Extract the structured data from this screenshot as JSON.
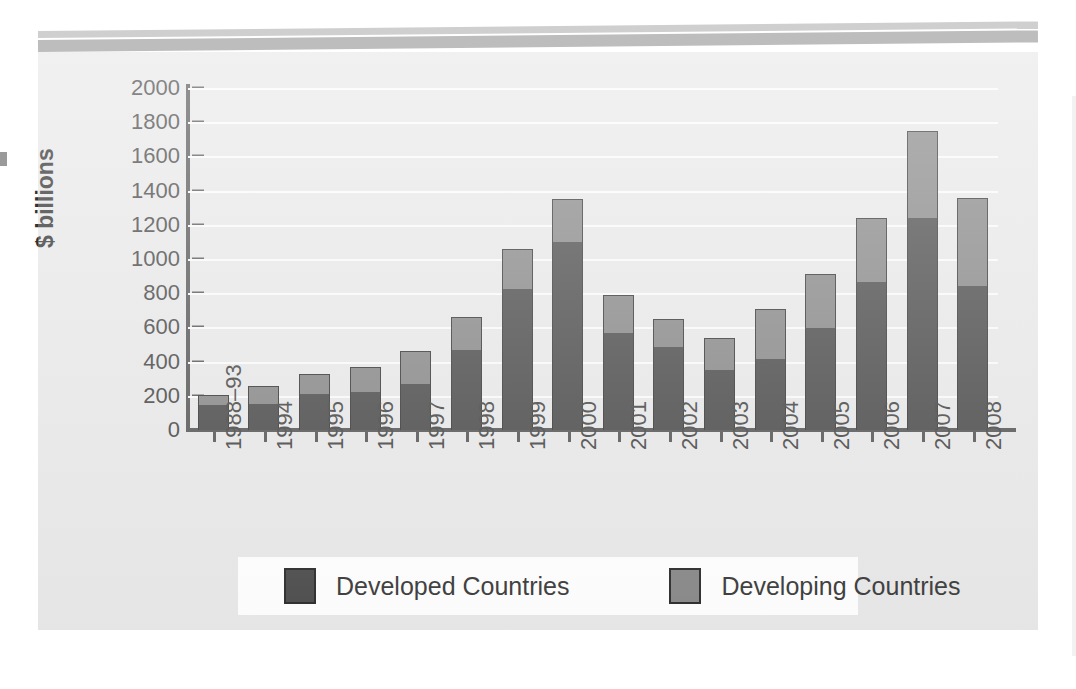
{
  "figure": {
    "panel_bg": "#e9e9e9",
    "legend_bg": "#ffffff"
  },
  "legend": {
    "items": [
      {
        "label": "Developed Countries",
        "color": "#4f4f4f",
        "key": "developed"
      },
      {
        "label": "Developing Countries",
        "color": "#8a8a8a",
        "key": "developing"
      }
    ]
  },
  "chart_data": {
    "type": "bar",
    "stacked": true,
    "title": "",
    "subtitle": "",
    "xlabel": "",
    "ylabel": "$ billions",
    "ylim": [
      0,
      2000
    ],
    "yticks": [
      0,
      200,
      400,
      600,
      800,
      1000,
      1200,
      1400,
      1600,
      1800,
      2000
    ],
    "ytick_labels": [
      "0",
      "200",
      "400",
      "600",
      "800",
      "1000",
      "1200",
      "1400",
      "1600",
      "1800",
      "2000"
    ],
    "grid": true,
    "grid_color": "#fbfbfb",
    "legend_position": "bottom",
    "categories": [
      "1988–93",
      "1994",
      "1995",
      "1996",
      "1997",
      "1998",
      "1999",
      "2000",
      "2001",
      "2002",
      "2003",
      "2004",
      "2005",
      "2006",
      "2007",
      "2008"
    ],
    "series": [
      {
        "name": "Developed Countries",
        "color": "#4f4f4f",
        "values": [
          145,
          155,
          210,
          220,
          270,
          470,
          825,
          1100,
          565,
          485,
          350,
          415,
          595,
          865,
          1240,
          840
        ]
      },
      {
        "name": "Developing Countries",
        "color": "#8a8a8a",
        "values": [
          60,
          100,
          115,
          150,
          190,
          190,
          235,
          250,
          225,
          165,
          190,
          290,
          315,
          375,
          510,
          515
        ]
      }
    ],
    "totals": [
      205,
      255,
      325,
      370,
      460,
      660,
      1060,
      1350,
      790,
      650,
      540,
      705,
      910,
      1240,
      1750,
      1355
    ]
  }
}
